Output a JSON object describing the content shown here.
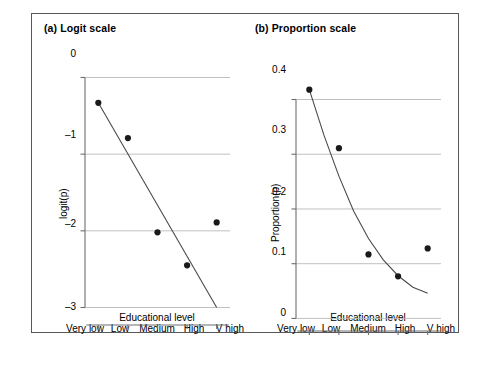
{
  "figure": {
    "background": "#ffffff",
    "border_color": "#58585a",
    "axis_color": "#6d6e70",
    "grid_color": "#b9babc",
    "point_color": "#1a1a1a",
    "line_color": "#4a4a4c"
  },
  "panels": [
    {
      "id": "a",
      "title": "(a) Logit scale",
      "xlabel": "Educational level",
      "ylabel": "logit(p)",
      "ytick_labels": [
        "0",
        "–1",
        "–2",
        "–3"
      ],
      "xtick_labels": [
        "Very low",
        "Low",
        "Medium",
        "High",
        "V high"
      ]
    },
    {
      "id": "b",
      "title": "(b) Proportion scale",
      "xlabel": "Educational level",
      "ylabel": "Proportion(p)",
      "ytick_labels": [
        "0.4",
        "0.3",
        "0.2",
        "0.1",
        "0"
      ],
      "xtick_labels": [
        "Very low",
        "Low",
        "Medium",
        "High",
        "V high"
      ]
    }
  ],
  "chart_data": [
    {
      "type": "scatter",
      "title": "(a) Logit scale",
      "xlabel": "Educational level",
      "ylabel": "logit(p)",
      "categories": [
        "Very low",
        "Low",
        "Medium",
        "High",
        "V high"
      ],
      "x": [
        1,
        2,
        3,
        4,
        5
      ],
      "values": [
        -0.33,
        -0.79,
        -2.02,
        -2.45,
        -1.89
      ],
      "ylim": [
        -3.15,
        0.15
      ],
      "yticks": [
        0,
        -1,
        -2,
        -3
      ],
      "grid": "horizontal",
      "legend": "none",
      "fit_line": {
        "name": "fitted logit (linear)",
        "type": "line",
        "x": [
          1,
          5
        ],
        "y": [
          -0.33,
          -3.0
        ]
      }
    },
    {
      "type": "scatter",
      "title": "(b) Proportion scale",
      "xlabel": "Educational level",
      "ylabel": "Proportion(p)",
      "categories": [
        "Very low",
        "Low",
        "Medium",
        "High",
        "V high"
      ],
      "x": [
        1,
        2,
        3,
        4,
        5
      ],
      "values": [
        0.418,
        0.311,
        0.117,
        0.077,
        0.128
      ],
      "ylim": [
        -0.012,
        0.432
      ],
      "yticks": [
        0.4,
        0.3,
        0.2,
        0.1,
        0
      ],
      "grid": "horizontal",
      "legend": "none",
      "fit_line": {
        "name": "fitted proportion (inverse logit)",
        "type": "curve",
        "x": [
          1,
          1.5,
          2,
          2.5,
          3,
          3.5,
          4,
          4.5,
          5
        ],
        "y": [
          0.418,
          0.334,
          0.26,
          0.196,
          0.146,
          0.107,
          0.078,
          0.057,
          0.046
        ]
      }
    }
  ]
}
